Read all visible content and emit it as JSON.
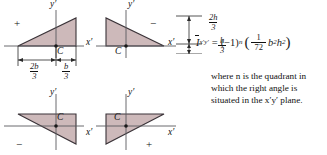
{
  "figure": {
    "shape_fill": "#cdb9ba",
    "shape_stroke": "#3a3338",
    "axis_color": "#5a5a5f",
    "text_color": "#111111"
  },
  "panels": [
    {
      "id": "quadrant-1",
      "sign": "+",
      "right_angle_quadrant": 1,
      "axis_x_label": "x′",
      "axis_y_label": "y′",
      "centroid_label": "C"
    },
    {
      "id": "quadrant-2",
      "sign": "−",
      "right_angle_quadrant": 2,
      "axis_x_label": "x′",
      "axis_y_label": "y′",
      "centroid_label": "C"
    },
    {
      "id": "quadrant-3",
      "sign": "−",
      "right_angle_quadrant": 3,
      "axis_x_label": "x′",
      "axis_y_label": "y′",
      "centroid_label": "C"
    },
    {
      "id": "quadrant-4",
      "sign": "+",
      "right_angle_quadrant": 4,
      "axis_x_label": "x′",
      "axis_y_label": "y′",
      "centroid_label": "C"
    }
  ],
  "dimensions": {
    "horizontal": [
      {
        "id": "dim-2b-over-3",
        "numerator": "2b",
        "denominator": "3"
      },
      {
        "id": "dim-b-over-3",
        "numerator": "b",
        "denominator": "3"
      }
    ],
    "vertical": [
      {
        "id": "dim-2h-over-3",
        "numerator": "2h",
        "denominator": "3"
      },
      {
        "id": "dim-h-over-3",
        "numerator": "h",
        "denominator": "3"
      }
    ]
  },
  "formula": {
    "symbol": "I",
    "subscript": "x′y′",
    "equals": "=",
    "factor_base": "(−1)",
    "factor_exponent": "n",
    "open_paren": "(",
    "fraction_numerator": "1",
    "fraction_denominator": "72",
    "term_b": "b",
    "term_b_exp": "2",
    "term_h": "h",
    "term_h_exp": "2",
    "close_paren": ")"
  },
  "note": {
    "line": "where n is the quadrant in which the right angle is situated in the x′y′ plane.",
    "var_n": "n",
    "var_plane": "x′y′"
  }
}
